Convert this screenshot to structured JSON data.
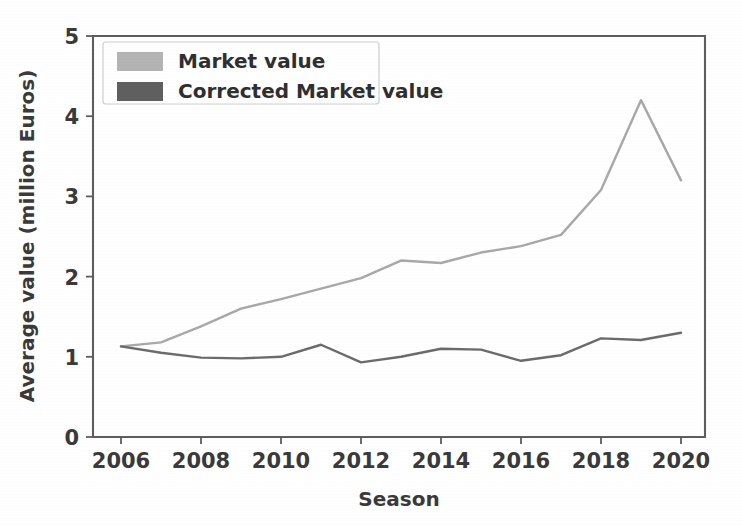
{
  "chart_data": {
    "type": "line",
    "title": "",
    "xlabel": "Season",
    "ylabel": "Average value (million Euros)",
    "xlim": [
      2005.3,
      2020.6
    ],
    "ylim": [
      0,
      5
    ],
    "grid": false,
    "legend_position": "upper-left",
    "xticks": [
      2006,
      2008,
      2010,
      2012,
      2014,
      2016,
      2018,
      2020
    ],
    "xtick_labels": [
      "2006",
      "2008",
      "2010",
      "2012",
      "2014",
      "2016",
      "2018",
      "2020"
    ],
    "yticks": [
      0,
      1,
      2,
      3,
      4,
      5
    ],
    "ytick_labels": [
      "0",
      "1",
      "2",
      "3",
      "4",
      "5"
    ],
    "x": [
      2006,
      2007,
      2008,
      2009,
      2010,
      2011,
      2012,
      2013,
      2014,
      2015,
      2016,
      2017,
      2018,
      2019,
      2020
    ],
    "series": [
      {
        "name": "Market value",
        "color": "#a8a8a8",
        "values": [
          1.13,
          1.18,
          1.38,
          1.6,
          1.72,
          1.85,
          1.98,
          2.2,
          2.17,
          2.3,
          2.38,
          2.52,
          3.08,
          4.2,
          3.2
        ]
      },
      {
        "name": "Corrected Market value",
        "color": "#6b6b6b",
        "values": [
          1.13,
          1.05,
          0.99,
          0.98,
          1.0,
          1.15,
          0.93,
          1.0,
          1.1,
          1.09,
          0.95,
          1.02,
          1.23,
          1.21,
          1.3
        ]
      }
    ]
  },
  "legend": {
    "entries": [
      {
        "label": "Market value",
        "swatch_color": "#b4b4b4"
      },
      {
        "label": "Corrected Market value",
        "swatch_color": "#5f5f5f"
      }
    ]
  },
  "axes": {
    "x_title": "Season",
    "y_title": "Average value (million Euros)"
  }
}
